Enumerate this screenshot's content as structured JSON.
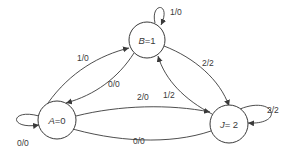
{
  "diagram": {
    "type": "state-transition-diagram",
    "nodes": [
      {
        "id": "A",
        "label_var": "A",
        "label_val": "=0"
      },
      {
        "id": "B",
        "label_var": "B",
        "label_val": "=1"
      },
      {
        "id": "J",
        "label_var": "J",
        "label_val": "= 2"
      }
    ],
    "edges": [
      {
        "from": "A",
        "to": "A",
        "label": "0/0"
      },
      {
        "from": "A",
        "to": "B",
        "label": "1/0"
      },
      {
        "from": "B",
        "to": "A",
        "label": "0/0"
      },
      {
        "from": "B",
        "to": "B",
        "label": "1/0"
      },
      {
        "from": "B",
        "to": "J",
        "label": "2/2"
      },
      {
        "from": "J",
        "to": "B",
        "label": "1/2"
      },
      {
        "from": "A",
        "to": "J",
        "label": "2/0"
      },
      {
        "from": "J",
        "to": "A",
        "label": "0/0"
      },
      {
        "from": "J",
        "to": "J",
        "label": "2/2"
      }
    ]
  }
}
